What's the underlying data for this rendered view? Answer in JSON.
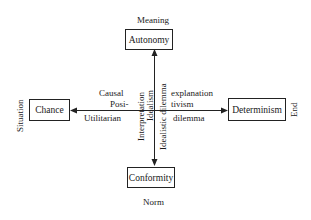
{
  "poles": {
    "top": {
      "box": "Autonomy",
      "caption": "Meaning"
    },
    "bottom": {
      "box": "Conformity",
      "caption": "Norm"
    },
    "left": {
      "box": "Chance",
      "caption": "Situation"
    },
    "right": {
      "box": "Determinism",
      "caption": "End"
    }
  },
  "axis_labels": {
    "upper_left": [
      "Causal",
      "Posi-"
    ],
    "upper_right": [
      "explanation",
      "tivism"
    ],
    "lower_left": "Utilitarian",
    "lower_right": "dilemma",
    "vertical_left_outer": "Interpretation",
    "vertical_left_inner": "Idealism",
    "vertical_right": "Idealistic dilemma"
  },
  "colors": {
    "ink": "#222222",
    "background": "#ffffff"
  }
}
